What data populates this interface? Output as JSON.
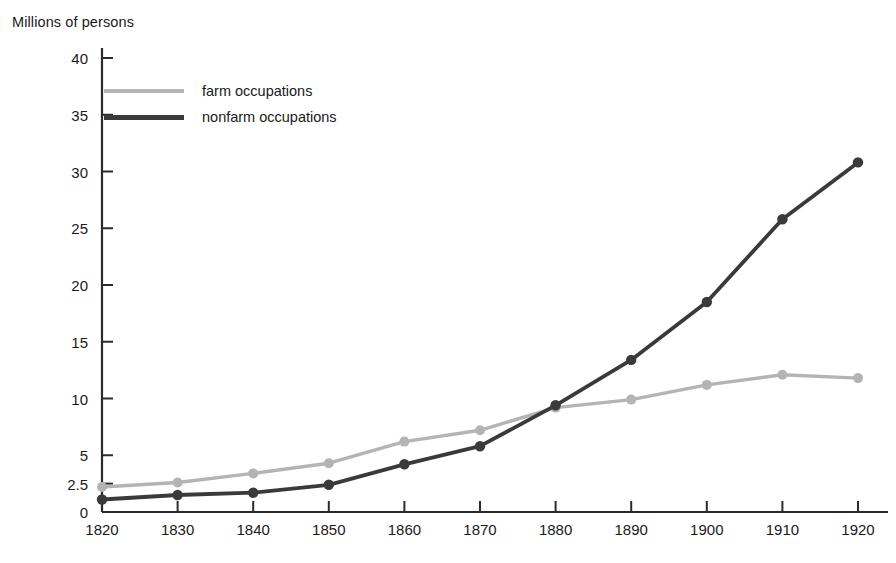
{
  "chart": {
    "axis_title": "Millions of persons",
    "y_ticks": [
      "0",
      "2.5",
      "5",
      "10",
      "15",
      "20",
      "25",
      "30",
      "35",
      "40"
    ],
    "x_ticks": [
      "1820",
      "1830",
      "1840",
      "1850",
      "1860",
      "1870",
      "1880",
      "1890",
      "1900",
      "1910",
      "1920"
    ],
    "legend": [
      {
        "label": "farm occupations",
        "color": "#b4b4b4"
      },
      {
        "label": "nonfarm occupations",
        "color": "#3a3a3a"
      }
    ]
  },
  "chart_data": {
    "type": "line",
    "title": "",
    "xlabel": "",
    "ylabel": "Millions of persons",
    "x": [
      1820,
      1830,
      1840,
      1850,
      1860,
      1870,
      1880,
      1890,
      1900,
      1910,
      1920
    ],
    "categories": [
      "1820",
      "1830",
      "1840",
      "1850",
      "1860",
      "1870",
      "1880",
      "1890",
      "1900",
      "1910",
      "1920"
    ],
    "series": [
      {
        "name": "farm occupations",
        "color": "#b4b4b4",
        "values": [
          2.2,
          2.6,
          3.4,
          4.3,
          6.2,
          7.2,
          9.2,
          9.9,
          11.2,
          12.1,
          11.8
        ]
      },
      {
        "name": "nonfarm occupations",
        "color": "#3a3a3a",
        "values": [
          1.1,
          1.5,
          1.7,
          2.4,
          4.2,
          5.8,
          9.4,
          13.4,
          18.5,
          25.8,
          30.8
        ]
      }
    ],
    "ylim": [
      0,
      40
    ],
    "xlim": [
      1820,
      1920
    ],
    "y_tick_values": [
      0,
      2.5,
      5,
      10,
      15,
      20,
      25,
      30,
      35,
      40
    ],
    "grid": false,
    "legend_position": "upper-left",
    "markers": "circle",
    "y_axis_note": "non-uniform tick spacing: extra tick at 2.5 between 0 and 5"
  }
}
